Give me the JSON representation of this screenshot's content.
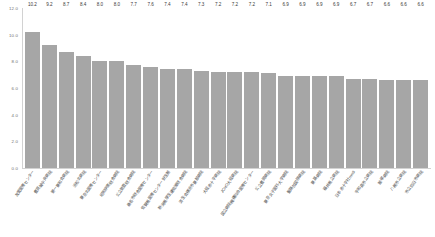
{
  "chart_data": {
    "type": "bar",
    "title": "",
    "subtitle": "",
    "xlabel": "",
    "ylabel": "",
    "ylim": [
      0.0,
      12.0
    ],
    "yticks": [
      "0.0",
      "2.0",
      "4.0",
      "6.0",
      "8.0",
      "10.0",
      "12.0"
    ],
    "ytick_values": [
      0.0,
      2.0,
      4.0,
      6.0,
      8.0,
      10.0,
      12.0
    ],
    "grid": false,
    "legend": false,
    "legend_position": "none",
    "bar_color": "#a6a6a6",
    "axis_color": "#d2d2d2",
    "label_color": "#3a3a3a",
    "categories": [
      "友愛医療センター",
      "豊見城中央病院",
      "第一東和会病院",
      "浜松北病院",
      "東京北医療センター",
      "昭和伊南総合病院",
      "公立能登総合病院",
      "桑名市総合医療センター",
      "佐賀県医療センター好生館",
      "新潟県厚生連佐渡総合病院",
      "済生会横浜市東部病院",
      "大阪赤十字病院",
      "JCHO大阪病院",
      "国立病院機構仙台医療センター",
      "公立豊岡病院",
      "東京女子医科大学病院",
      "聖路加国際病院",
      "東葛病院",
      "福井県立病院",
      "日本赤十字社medi",
      "宇和島市立病院",
      "飯塚病院",
      "八尾市立病院",
      "市立四日市病院"
    ],
    "values": [
      10.2,
      9.2,
      8.7,
      8.4,
      8.0,
      8.0,
      7.7,
      7.6,
      7.4,
      7.4,
      7.3,
      7.2,
      7.2,
      7.2,
      7.1,
      6.9,
      6.9,
      6.9,
      6.9,
      6.7,
      6.7,
      6.6,
      6.6,
      6.6
    ],
    "value_labels": [
      "10.2",
      "9.2",
      "8.7",
      "8.4",
      "8.0",
      "8.0",
      "7.7",
      "7.6",
      "7.4",
      "7.4",
      "7.3",
      "7.2",
      "7.2",
      "7.2",
      "7.1",
      "6.9",
      "6.9",
      "6.9",
      "6.9",
      "6.7",
      "6.7",
      "6.6",
      "6.6",
      "6.6"
    ]
  }
}
